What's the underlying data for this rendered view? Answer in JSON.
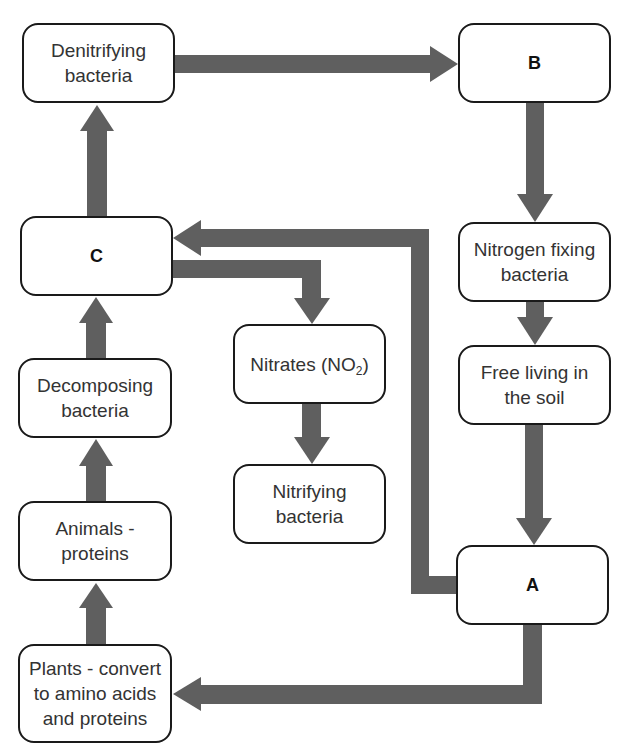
{
  "diagram": {
    "arrow_color": "#5f5f5f",
    "nodes": {
      "denitrifying": {
        "label": "Denitrifying\nbacteria"
      },
      "b": {
        "label": "B"
      },
      "c": {
        "label": "C"
      },
      "nitrogen_fixing": {
        "label": "Nitrogen fixing\nbacteria"
      },
      "decomposing": {
        "label": "Decomposing\nbacteria"
      },
      "nitrates": {
        "label_prefix": "Nitrates (NO",
        "label_sub": "2",
        "label_suffix": ")"
      },
      "free_living": {
        "label": "Free living in\nthe soil"
      },
      "nitrifying": {
        "label": "Nitrifying\nbacteria"
      },
      "animals": {
        "label": "Animals -\nproteins"
      },
      "a": {
        "label": "A"
      },
      "plants": {
        "label": "Plants - convert\nto amino acids\nand proteins"
      }
    },
    "edges": [
      {
        "from": "Denitrifying bacteria",
        "to": "B"
      },
      {
        "from": "B",
        "to": "Nitrogen fixing bacteria"
      },
      {
        "from": "Nitrogen fixing bacteria",
        "to": "Free living in the soil"
      },
      {
        "from": "Free living in the soil",
        "to": "A"
      },
      {
        "from": "A",
        "to": "C"
      },
      {
        "from": "A",
        "to": "Plants - convert to amino acids and proteins"
      },
      {
        "from": "Plants - convert to amino acids and proteins",
        "to": "Animals - proteins"
      },
      {
        "from": "Animals - proteins",
        "to": "Decomposing bacteria"
      },
      {
        "from": "Decomposing bacteria",
        "to": "C"
      },
      {
        "from": "C",
        "to": "Denitrifying bacteria"
      },
      {
        "from": "C",
        "to": "Nitrates (NO2)"
      },
      {
        "from": "Nitrates (NO2)",
        "to": "Nitrifying bacteria"
      }
    ]
  }
}
